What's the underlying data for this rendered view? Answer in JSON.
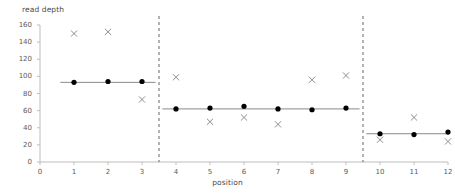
{
  "chart_data": {
    "type": "scatter",
    "title": "",
    "xlabel": "position",
    "ylabel": "read depth",
    "xlim": [
      0,
      12
    ],
    "ylim": [
      0,
      160
    ],
    "xticks": [
      0,
      1,
      2,
      3,
      4,
      5,
      6,
      7,
      8,
      9,
      10,
      11,
      12
    ],
    "yticks": [
      0,
      20,
      40,
      60,
      80,
      100,
      120,
      140,
      160
    ],
    "grid": false,
    "legend": null,
    "x": [
      1,
      2,
      3,
      4,
      5,
      6,
      7,
      8,
      9,
      10,
      11,
      12
    ],
    "series": [
      {
        "name": "segment mean",
        "marker": "filled-circle",
        "color": "#000000",
        "values": [
          93,
          94,
          94,
          62,
          63,
          65,
          62,
          61,
          63,
          33,
          32,
          35
        ]
      },
      {
        "name": "observed read depth",
        "marker": "x",
        "color": "#808080",
        "values": [
          150,
          152,
          73,
          99,
          47,
          52,
          44,
          96,
          101,
          26,
          52,
          24
        ]
      }
    ],
    "segments": [
      {
        "x_start": 0.6,
        "x_end": 3.4,
        "level": 93
      },
      {
        "x_start": 3.6,
        "x_end": 9.4,
        "level": 62
      },
      {
        "x_start": 9.6,
        "x_end": 12.0,
        "level": 33
      }
    ],
    "breakpoints": [
      3.5,
      9.5
    ],
    "breakpoint_style": "dashed",
    "breakpoint_color": "#555555"
  }
}
